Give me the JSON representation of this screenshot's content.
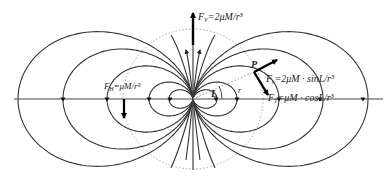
{
  "diagram": {
    "center": {
      "x": 193,
      "y": 99
    },
    "axis_y": 99,
    "reference_circle_radius": 70,
    "field_line_scales": [
      24,
      44,
      86,
      130,
      175
    ],
    "equator_marks": [
      -130,
      -86,
      -44,
      -23,
      23,
      44,
      86,
      127,
      170
    ],
    "labels": {
      "vertical_pole": {
        "text_main": "F",
        "sub": "V",
        "rest": "=2μM/r³",
        "x": 198,
        "y": 20
      },
      "horizontal_equator": {
        "text_main": "F",
        "sub": "H",
        "rest": "=μM/r³",
        "x": 104,
        "y": 89
      },
      "point": {
        "text": "P",
        "x": 251,
        "y": 68
      },
      "radial_component": {
        "text_main": "F",
        "sub": "r",
        "rest": "=2μM · sinL/r³",
        "x": 266,
        "y": 82
      },
      "tangential_component": {
        "text_main": "F",
        "sub": "T",
        "rest": "=μM · cosL/r³",
        "x": 268,
        "y": 101
      },
      "latitude": {
        "text": "L",
        "x": 213,
        "y": 104
      },
      "radius": {
        "text": "r",
        "x": 238,
        "y": 93
      }
    },
    "colors": {
      "lines": "#333333",
      "arrows": "#000000",
      "reference_circle": "#aaaaaa"
    }
  }
}
